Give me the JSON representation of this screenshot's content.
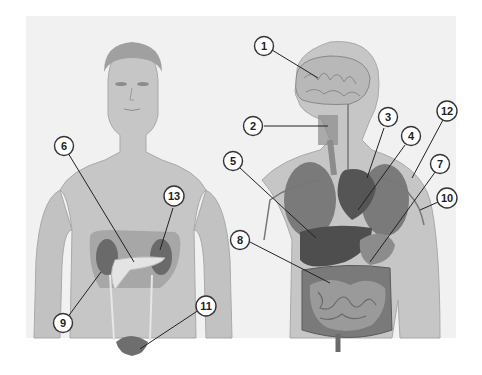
{
  "diagram": {
    "title": "",
    "figures": [
      {
        "name": "front-view-figure",
        "description": "male body front view showing kidneys, pancreas, ureters, bladder"
      },
      {
        "name": "side-view-figure",
        "description": "male body side/three-quarter view showing brain, throat, heart, lungs, liver, stomach, intestines, vessels"
      }
    ],
    "callouts": [
      {
        "label": "1"
      },
      {
        "label": "2"
      },
      {
        "label": "3"
      },
      {
        "label": "4"
      },
      {
        "label": "5"
      },
      {
        "label": "6"
      },
      {
        "label": "7"
      },
      {
        "label": "8"
      },
      {
        "label": "9"
      },
      {
        "label": "10"
      },
      {
        "label": "11"
      },
      {
        "label": "12"
      },
      {
        "label": "13"
      }
    ],
    "colors": {
      "background": "#f1f1f1",
      "skin": "#c9c9c9",
      "organ_dark": "#5a5a5a",
      "organ_mid": "#8a8a8a",
      "callout_stroke": "#333333"
    }
  }
}
